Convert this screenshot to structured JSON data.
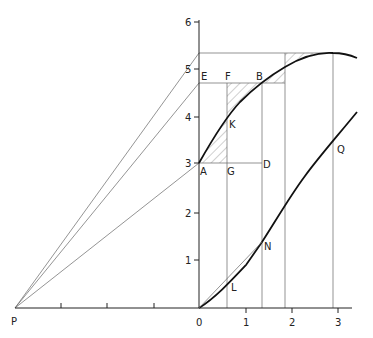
{
  "diagram": {
    "x_axis": {
      "ticks": [
        {
          "label": "0",
          "x": 199
        },
        {
          "label": "1",
          "x": 246
        },
        {
          "label": "2",
          "x": 292
        },
        {
          "label": "3",
          "x": 338
        }
      ],
      "left_ticks_x": [
        61,
        107,
        154
      ]
    },
    "y_axis": {
      "ticks": [
        {
          "label": "1",
          "y": 260
        },
        {
          "label": "2",
          "y": 213
        },
        {
          "label": "3",
          "y": 163
        },
        {
          "label": "4",
          "y": 117
        },
        {
          "label": "5",
          "y": 69
        },
        {
          "label": "6",
          "y": 22
        }
      ]
    },
    "points": {
      "P": "P",
      "E": "E",
      "F": "F",
      "B": "B",
      "K": "K",
      "A": "A",
      "G": "G",
      "D": "D",
      "Q": "Q",
      "N": "N",
      "L": "L"
    },
    "curves": [
      {
        "name": "upper-curve",
        "description": "Concave curve starting at A (0,3), passing K and B, peaking near x=2.9, y=5.2"
      },
      {
        "name": "lower-curve",
        "description": "Convex curve starting at origin, passing L, N and Q"
      }
    ],
    "rays_from_P": [
      {
        "to_y_value": 5.2
      },
      {
        "to_y_value": 4.6
      },
      {
        "to_y_value": 3.0
      }
    ]
  }
}
